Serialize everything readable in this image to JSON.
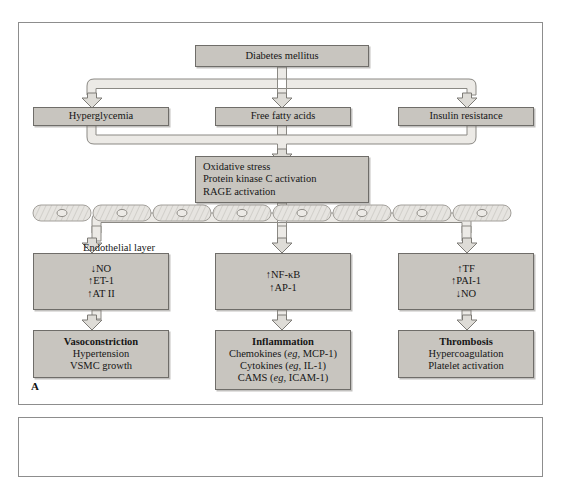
{
  "figure": {
    "panel_letter_a": "A",
    "background": "#ffffff",
    "box_fill": "#c8c5bf",
    "box_stroke": "#6f6d69",
    "connector_fill": "#e8e6e2",
    "connector_stroke": "#8b8984",
    "panel_border": "#8d8d8d"
  },
  "nodes": {
    "root": {
      "label": "Diabetes mellitus"
    },
    "tier1": [
      {
        "label": "Hyperglycemia"
      },
      {
        "label": "Free fatty acids"
      },
      {
        "label": "Insulin resistance"
      }
    ],
    "mechanism": {
      "lines": [
        "Oxidative stress",
        "Protein kinase C activation",
        "RAGE activation"
      ]
    },
    "endothelium": {
      "label": "Endothelial layer"
    },
    "mediators": [
      {
        "lines": [
          "↓NO",
          "↑ET-1",
          "↑AT II"
        ]
      },
      {
        "lines": [
          "↑NF-κB",
          "↑AP-1"
        ]
      },
      {
        "lines": [
          "↑TF",
          "↑PAI-1",
          "↓NO"
        ]
      }
    ],
    "outcomes": [
      {
        "title": "Vasoconstriction",
        "items": [
          {
            "pre": "Hypertension",
            "em": "",
            "post": ""
          },
          {
            "pre": "VSMC growth",
            "em": "",
            "post": ""
          }
        ]
      },
      {
        "title": "Inflammation",
        "items": [
          {
            "pre": "Chemokines (",
            "em": "eg,",
            "post": " MCP-1)"
          },
          {
            "pre": "Cytokines (",
            "em": "eg,",
            "post": " IL-1)"
          },
          {
            "pre": "CAMS (",
            "em": "eg,",
            "post": " ICAM-1)"
          }
        ]
      },
      {
        "title": "Thrombosis",
        "items": [
          {
            "pre": "Hypercoagulation",
            "em": "",
            "post": ""
          },
          {
            "pre": "Platelet activation",
            "em": "",
            "post": ""
          }
        ]
      }
    ]
  },
  "icons": {
    "down_arrow": "down-block-arrow-icon",
    "endothelial_cell": "endothelial-cell-icon",
    "cell_nucleus": "cell-nucleus-icon"
  }
}
